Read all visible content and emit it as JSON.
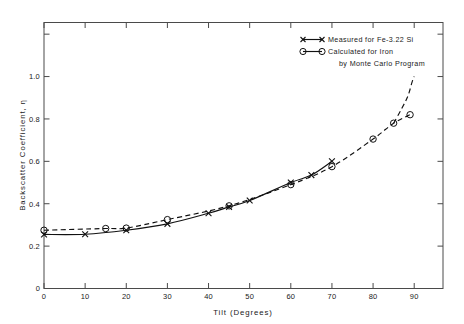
{
  "chart_data": {
    "type": "line",
    "title": "",
    "xlabel": "Tilt   (Degrees)",
    "ylabel": "Backscatter   Coefficient,  η",
    "xlim": [
      0,
      97
    ],
    "ylim": [
      0,
      1.255
    ],
    "grid": false,
    "legend_position": "top-right",
    "xticks": [
      0,
      10,
      20,
      30,
      40,
      50,
      60,
      70,
      80,
      90
    ],
    "xticklabels": [
      "0",
      "10",
      "20",
      "30",
      "40",
      "50",
      "60",
      "70",
      "80",
      "90"
    ],
    "yticks": [
      0,
      0.2,
      0.4,
      0.6,
      0.8,
      1.0,
      1.2
    ],
    "yticklabels": [
      "0",
      "0.2",
      "0.4",
      "0.6",
      "0.8",
      "1.0",
      ""
    ],
    "series": [
      {
        "name": "Measured for Fe-3.22 Si",
        "marker": "cross",
        "linestyle": "solid",
        "x": [
          0,
          10,
          20,
          30,
          40,
          45,
          50,
          60,
          65,
          70
        ],
        "y": [
          0.255,
          0.256,
          0.275,
          0.305,
          0.355,
          0.385,
          0.415,
          0.5,
          0.535,
          0.6
        ]
      },
      {
        "name": "Calculated for Iron by Monte Carlo Program",
        "marker": "circle",
        "linestyle": "dashed",
        "x": [
          0,
          15,
          20,
          30,
          45,
          60,
          70,
          80,
          85,
          89
        ],
        "y": [
          0.275,
          0.283,
          0.285,
          0.325,
          0.39,
          0.49,
          0.575,
          0.705,
          0.78,
          0.82
        ]
      }
    ],
    "extrapolation": {
      "note": "dashed calculated curve continues upward to 1.0 at 90 degrees",
      "x": [
        85,
        87,
        88.5,
        89.5,
        90
      ],
      "y": [
        0.78,
        0.85,
        0.91,
        0.975,
        1.0
      ]
    }
  },
  "legend": {
    "entries": [
      {
        "marker": "cross-line",
        "label": "Measured  for  Fe-3.22 Si"
      },
      {
        "marker": "circle-line",
        "label": "Calculated  for  Iron"
      },
      {
        "marker": "none",
        "label": "by  Monte Carlo  Program"
      }
    ]
  },
  "colors": {
    "ink": "#111111",
    "frame": "#4a4a4a",
    "background": "#ffffff"
  }
}
